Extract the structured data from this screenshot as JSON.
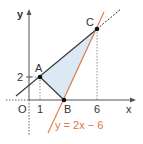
{
  "figure": {
    "axes": {
      "x_label": "x",
      "y_label": "y",
      "origin_label": "O"
    },
    "ticks": {
      "x": [
        "1",
        "6"
      ],
      "y": [
        "2"
      ]
    },
    "points": [
      {
        "name": "A",
        "coords": [
          1,
          2
        ]
      },
      {
        "name": "B",
        "coords": [
          3,
          0
        ]
      },
      {
        "name": "C",
        "coords": [
          6,
          6
        ]
      }
    ],
    "line_label": "y = 2x − 6",
    "colors": {
      "line_orange": "#e07840",
      "triangle_fill": "#dce8f4",
      "lines_dark": "#333333",
      "axes": "#555555"
    }
  }
}
